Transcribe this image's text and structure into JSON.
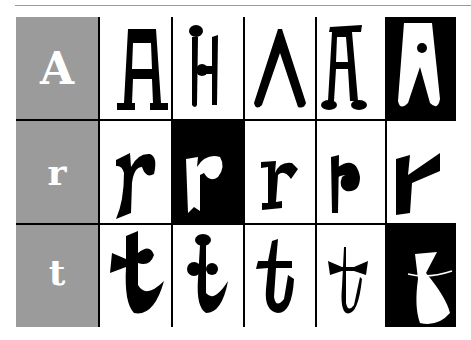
{
  "colors": {
    "label_bg": "#9b9b9b",
    "ink": "#000000",
    "paper": "#ffffff"
  },
  "rows": [
    {
      "label": "A",
      "variants": [
        "A slab-serif",
        "A ball-top",
        "A lambda",
        "A bar-top ball-feet",
        "A inverted white"
      ]
    },
    {
      "label": "r",
      "variants": [
        "r brush",
        "r inverted white",
        "r serif",
        "r spiral",
        "r wedge"
      ]
    },
    {
      "label": "t",
      "variants": [
        "t flared",
        "t ball-top",
        "t crossbar",
        "t bowtie",
        "t vase inverted white"
      ]
    }
  ]
}
